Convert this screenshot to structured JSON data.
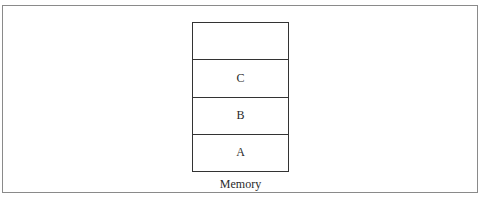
{
  "diagram": {
    "cells": [
      "",
      "C",
      "B",
      "A"
    ],
    "caption": "Memory"
  }
}
